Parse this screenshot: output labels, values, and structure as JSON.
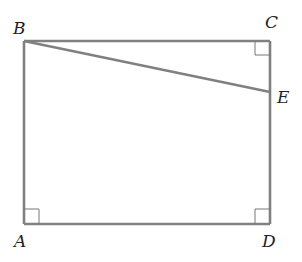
{
  "figure": {
    "type": "geometry-diagram",
    "colors": {
      "line": "#808080",
      "marker": "#777777",
      "text": "#222222",
      "background": "#ffffff"
    },
    "points": {
      "A": {
        "label": "A",
        "x": 24,
        "y": 224
      },
      "B": {
        "label": "B",
        "x": 24,
        "y": 41
      },
      "C": {
        "label": "C",
        "x": 270,
        "y": 41
      },
      "D": {
        "label": "D",
        "x": 270,
        "y": 224
      },
      "E": {
        "label": "E",
        "x": 270,
        "y": 92
      }
    },
    "segments": [
      {
        "from": "A",
        "to": "B"
      },
      {
        "from": "B",
        "to": "C"
      },
      {
        "from": "C",
        "to": "D"
      },
      {
        "from": "D",
        "to": "A"
      },
      {
        "from": "B",
        "to": "E"
      }
    ],
    "right_angle_markers": [
      "A",
      "C",
      "D"
    ]
  }
}
